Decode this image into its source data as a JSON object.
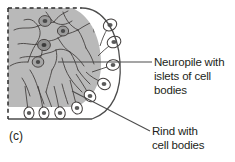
{
  "figure": {
    "caption": "(c)",
    "colors": {
      "neuropile_fill": "#b9b9b9",
      "rind_fill": "#ffffff",
      "outline": "#4d4d4d",
      "text": "#231f20",
      "background": "#ffffff"
    }
  },
  "labels": {
    "neuropile": {
      "line1": "Neuropile with",
      "line2": "islets of cell",
      "line3": "bodies"
    },
    "rind": {
      "line1": "Rind with",
      "line2": "cell bodies"
    }
  },
  "diagram": {
    "neuropile_region_name": "neuropile-region",
    "rind_region_name": "rind-region",
    "cut_edge_style": "dashed",
    "outer_edge_style": "solid-arc"
  }
}
